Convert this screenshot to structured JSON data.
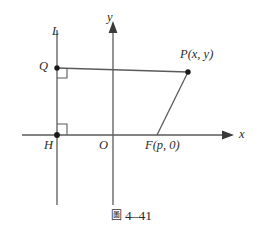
{
  "figure": {
    "caption_prefix": "圖",
    "caption_number": "4–41",
    "background_color": "#ffffff",
    "line_color": "#5a5a5a",
    "text_color": "#2b2b2b"
  },
  "axes": {
    "x_label": "x",
    "y_label": "y",
    "origin_label": "O",
    "x_axis": {
      "x1": 22,
      "y1": 135,
      "x2": 232,
      "y2": 135,
      "arrow": "right"
    },
    "y_axis": {
      "x1": 113,
      "y1": 205,
      "x2": 113,
      "y2": 22,
      "arrow": "up"
    }
  },
  "directrix": {
    "label": "L",
    "x1": 57,
    "y1": 30,
    "x2": 57,
    "y2": 205
  },
  "points": [
    {
      "name": "Q",
      "label": "Q",
      "x": 57,
      "y": 68,
      "dot": true
    },
    {
      "name": "P",
      "label": "P(x, y)",
      "label_main": "P",
      "x": 188,
      "y": 72,
      "dot": true
    },
    {
      "name": "H",
      "label": "H",
      "x": 57,
      "y": 135,
      "dot": true
    },
    {
      "name": "F",
      "label": "F(p, 0)",
      "label_main": "F",
      "x": 157,
      "y": 135,
      "dot": true
    },
    {
      "name": "O",
      "label": "O",
      "x": 113,
      "y": 135,
      "dot": false
    }
  ],
  "segments": [
    {
      "name": "QP",
      "from": "Q",
      "to": "P",
      "x1": 57,
      "y1": 68,
      "x2": 188,
      "y2": 72
    },
    {
      "name": "FP",
      "from": "F",
      "to": "P",
      "x1": 157,
      "y1": 135,
      "x2": 188,
      "y2": 72
    }
  ],
  "right_angles": [
    {
      "name": "right-angle-at-Q",
      "x": 57,
      "y": 68,
      "size": 9,
      "dir_x": 1,
      "dir_y": 1
    },
    {
      "name": "right-angle-at-H",
      "x": 57,
      "y": 135,
      "size": 9,
      "dir_x": 1,
      "dir_y": -1
    }
  ],
  "labels": {
    "L": {
      "text": "L",
      "left": 52,
      "top": 25
    },
    "Q": {
      "text": "Q",
      "left": 41,
      "top": 61
    },
    "P": {
      "text": "P(x, y)",
      "left": 182,
      "top": 50
    },
    "H": {
      "text": "H",
      "left": 45,
      "top": 139
    },
    "O": {
      "text": "O",
      "left": 100,
      "top": 139
    },
    "F": {
      "text": "F(p, 0)",
      "left": 146,
      "top": 139
    },
    "x": {
      "text": "x",
      "left": 238,
      "top": 128
    },
    "y": {
      "text": "y",
      "left": 107,
      "top": 12
    }
  }
}
